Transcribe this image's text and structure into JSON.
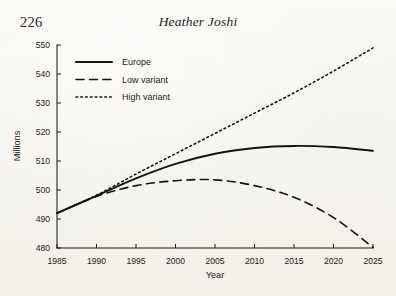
{
  "page": {
    "folio": "226",
    "running_head": "Heather Joshi",
    "background_color": "#fbfaf6",
    "ink_color": "#1d1d1b"
  },
  "chart_data": {
    "type": "line",
    "title": "",
    "xlabel": "Year",
    "ylabel": "Millions",
    "xlim": [
      1985,
      2025
    ],
    "ylim": [
      480,
      550
    ],
    "xticks": [
      1985,
      1990,
      1995,
      2000,
      2005,
      2010,
      2015,
      2020,
      2025
    ],
    "yticks": [
      480,
      490,
      500,
      510,
      520,
      530,
      540,
      550
    ],
    "xtick_labels": [
      "1985",
      "1990",
      "1995",
      "2000",
      "2005",
      "2010",
      "2015",
      "2020",
      "2025"
    ],
    "ytick_labels": [
      "480",
      "490",
      "500",
      "510",
      "520",
      "530",
      "540",
      "550"
    ],
    "grid": false,
    "legend_position": "upper left",
    "x": [
      1985,
      1990,
      1995,
      2000,
      2005,
      2010,
      2015,
      2020,
      2025
    ],
    "series": [
      {
        "name": "Europe",
        "style": "solid",
        "color": "#141413",
        "values": [
          492.0,
          498.0,
          504.0,
          509.0,
          512.5,
          514.5,
          515.2,
          514.8,
          513.5
        ]
      },
      {
        "name": "Low variant",
        "style": "dashed",
        "color": "#141413",
        "values": [
          492.0,
          497.8,
          501.5,
          503.2,
          503.5,
          501.5,
          497.5,
          490.5,
          480.2
        ]
      },
      {
        "name": "High variant",
        "style": "dotted",
        "color": "#141413",
        "values": [
          492.0,
          498.2,
          505.5,
          512.5,
          519.5,
          526.5,
          533.5,
          541.0,
          549.0
        ]
      }
    ]
  }
}
